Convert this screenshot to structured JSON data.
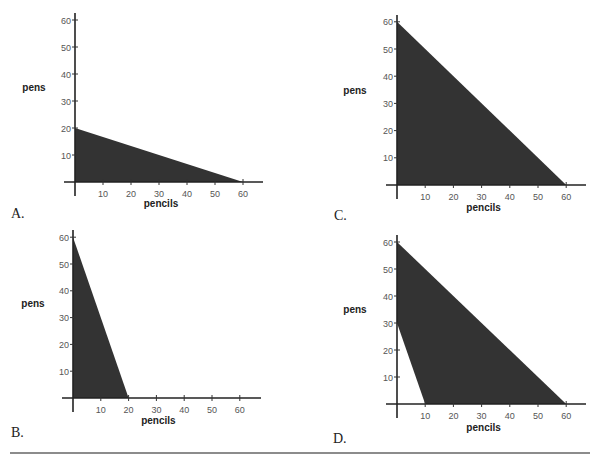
{
  "chart_data": [
    {
      "type": "area",
      "panel": "A.",
      "xlabel": "pencils",
      "ylabel": "pens",
      "xlim": [
        0,
        65
      ],
      "ylim": [
        0,
        63
      ],
      "xticks": [
        10,
        20,
        30,
        40,
        50,
        60
      ],
      "yticks": [
        10,
        20,
        30,
        40,
        50,
        60
      ],
      "region": [
        [
          0,
          0
        ],
        [
          0,
          20
        ],
        [
          60,
          0
        ]
      ],
      "fill_color": "#333333"
    },
    {
      "type": "area",
      "panel": "B.",
      "xlabel": "pencils",
      "ylabel": "pens",
      "xlim": [
        0,
        65
      ],
      "ylim": [
        0,
        63
      ],
      "xticks": [
        10,
        20,
        30,
        40,
        50,
        60
      ],
      "yticks": [
        10,
        20,
        30,
        40,
        50,
        60
      ],
      "region": [
        [
          0,
          0
        ],
        [
          0,
          60
        ],
        [
          20,
          0
        ]
      ],
      "fill_color": "#333333"
    },
    {
      "type": "area",
      "panel": "C.",
      "xlabel": "pencils",
      "ylabel": "pens",
      "xlim": [
        0,
        65
      ],
      "ylim": [
        0,
        63
      ],
      "xticks": [
        10,
        20,
        30,
        40,
        50,
        60
      ],
      "yticks": [
        10,
        20,
        30,
        40,
        50,
        60
      ],
      "region": [
        [
          0,
          0
        ],
        [
          0,
          60
        ],
        [
          60,
          0
        ]
      ],
      "fill_color": "#333333"
    },
    {
      "type": "area",
      "panel": "D.",
      "xlabel": "pencils",
      "ylabel": "pens",
      "xlim": [
        0,
        65
      ],
      "ylim": [
        0,
        63
      ],
      "xticks": [
        10,
        20,
        30,
        40,
        50,
        60
      ],
      "yticks": [
        10,
        20,
        30,
        40,
        50,
        60
      ],
      "region": [
        [
          0,
          30
        ],
        [
          0,
          60
        ],
        [
          60,
          0
        ],
        [
          10,
          0
        ]
      ],
      "fill_color": "#333333"
    }
  ]
}
